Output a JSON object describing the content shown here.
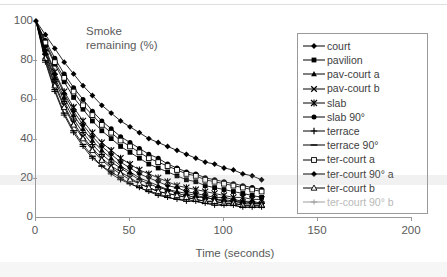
{
  "chart_data": {
    "type": "line",
    "xlabel": "Time (seconds)",
    "ylabel": "",
    "xlim": [
      0,
      200
    ],
    "ylim": [
      0,
      100
    ],
    "xticks": [
      0,
      50,
      100,
      150,
      200
    ],
    "yticks": [
      0,
      20,
      40,
      60,
      80,
      100
    ],
    "grid": false,
    "legend_position": "right",
    "x": [
      0,
      5,
      10,
      15,
      20,
      25,
      30,
      35,
      40,
      45,
      50,
      55,
      60,
      65,
      70,
      75,
      80,
      85,
      90,
      95,
      100,
      105,
      110,
      115,
      120
    ],
    "series": [
      {
        "name": "court",
        "marker": "diamond-filled",
        "values": [
          100,
          93,
          86,
          79,
          73,
          67,
          62,
          57,
          53,
          49,
          46,
          43,
          40,
          38,
          36,
          34,
          32,
          30,
          28,
          27,
          25,
          24,
          22,
          21,
          19
        ]
      },
      {
        "name": "pavilion",
        "marker": "square-filled",
        "values": [
          100,
          88,
          78,
          69,
          61,
          55,
          49,
          44,
          40,
          36,
          33,
          30,
          27,
          25,
          23,
          21,
          19,
          18,
          16,
          15,
          14,
          13,
          12,
          11,
          10
        ]
      },
      {
        "name": "pav-court a",
        "marker": "triangle-filled",
        "values": [
          100,
          84,
          71,
          61,
          52,
          45,
          39,
          34,
          30,
          26,
          23,
          20,
          18,
          16,
          14,
          13,
          12,
          11,
          10,
          9,
          9,
          8,
          8,
          7,
          7
        ]
      },
      {
        "name": "pav-court b",
        "marker": "cross",
        "values": [
          100,
          82,
          68,
          57,
          48,
          41,
          35,
          30,
          26,
          23,
          20,
          17,
          15,
          13,
          12,
          11,
          10,
          9,
          8,
          8,
          7,
          7,
          6,
          6,
          6
        ]
      },
      {
        "name": "slab",
        "marker": "star",
        "values": [
          100,
          86,
          74,
          64,
          56,
          49,
          43,
          38,
          34,
          30,
          27,
          24,
          22,
          20,
          18,
          16,
          15,
          14,
          13,
          12,
          11,
          10,
          10,
          9,
          9
        ]
      },
      {
        "name": "slab 90°",
        "marker": "circle-filled",
        "values": [
          100,
          90,
          81,
          73,
          66,
          60,
          54,
          49,
          45,
          41,
          38,
          35,
          32,
          30,
          27,
          25,
          23,
          22,
          20,
          19,
          18,
          17,
          16,
          15,
          14
        ]
      },
      {
        "name": "terrace",
        "marker": "plus",
        "values": [
          100,
          83,
          70,
          59,
          50,
          43,
          37,
          32,
          28,
          25,
          22,
          19,
          17,
          15,
          14,
          12,
          11,
          10,
          10,
          9,
          8,
          8,
          7,
          7,
          7
        ]
      },
      {
        "name": "terrace 90°",
        "marker": "dash",
        "values": [
          100,
          80,
          65,
          53,
          44,
          37,
          31,
          26,
          23,
          20,
          17,
          15,
          13,
          12,
          10,
          9,
          9,
          8,
          7,
          7,
          6,
          6,
          5,
          5,
          5
        ]
      },
      {
        "name": "ter-court a",
        "marker": "square-open",
        "values": [
          100,
          89,
          79,
          71,
          64,
          57,
          52,
          47,
          43,
          39,
          36,
          33,
          30,
          28,
          26,
          24,
          22,
          21,
          19,
          18,
          17,
          16,
          15,
          14,
          13
        ]
      },
      {
        "name": "ter-court 90° a",
        "marker": "diamond-filled",
        "values": [
          100,
          85,
          73,
          63,
          54,
          47,
          41,
          36,
          32,
          28,
          25,
          22,
          20,
          18,
          16,
          15,
          13,
          12,
          11,
          10,
          10,
          9,
          8,
          8,
          7
        ]
      },
      {
        "name": "ter-court b",
        "marker": "triangle-open",
        "values": [
          100,
          81,
          67,
          56,
          47,
          40,
          34,
          29,
          25,
          22,
          19,
          17,
          15,
          13,
          12,
          11,
          10,
          9,
          8,
          8,
          7,
          7,
          6,
          6,
          6
        ]
      },
      {
        "name": "ter-court 90° b",
        "marker": "dash-open",
        "values": [
          100,
          79,
          64,
          52,
          43,
          36,
          30,
          26,
          22,
          19,
          17,
          15,
          13,
          11,
          10,
          9,
          8,
          8,
          7,
          6,
          6,
          6,
          5,
          5,
          5
        ]
      }
    ]
  },
  "legend": {
    "items": [
      {
        "label": "court"
      },
      {
        "label": "pavilion"
      },
      {
        "label": "pav-court a"
      },
      {
        "label": "pav-court b"
      },
      {
        "label": "slab"
      },
      {
        "label": "slab 90°"
      },
      {
        "label": "terrace"
      },
      {
        "label": "terrace 90°"
      },
      {
        "label": "ter-court a"
      },
      {
        "label": "ter-court 90° a"
      },
      {
        "label": "ter-court b"
      },
      {
        "label": "ter-court 90° b"
      }
    ]
  },
  "colors": {
    "line": "#000000",
    "axis": "#9a9a9a",
    "text": "#5a5a5a"
  }
}
